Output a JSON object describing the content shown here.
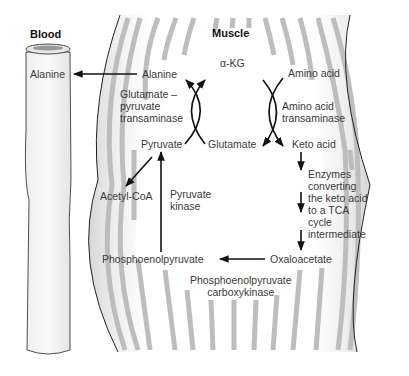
{
  "regions": {
    "blood": "Blood",
    "muscle": "Muscle"
  },
  "metabolites": {
    "alanine_blood": "Alanine",
    "alanine_muscle": "Alanine",
    "alpha_kg": "α-KG",
    "amino_acid": "Amino acid",
    "pyruvate": "Pyruvate",
    "glutamate": "Glutamate",
    "keto_acid": "Keto acid",
    "acetyl_coa": "Acetyl-CoA",
    "phosphoenolpyruvate": "Phosphoenolpyruvate",
    "oxaloacetate": "Oxaloacetate"
  },
  "enzymes": {
    "glutamate_pyruvate_transaminase": "Glutamate –\npyruvate\ntransaminase",
    "amino_acid_transaminase": "Amino acid\ntransaminase",
    "pyruvate_kinase": "Pyruvate\nkinase",
    "keto_acid_enzymes": "Enzymes\nconverting\nthe keto acid\nto a TCA\ncycle\nintermediate",
    "pepck": "Phosphoenolpyruvate\ncarboxykinase"
  },
  "colors": {
    "stripe": "#bdbdbd",
    "muscle_shade": "#dcdcdc",
    "outline": "#222222",
    "arrow": "#111111",
    "text": "#3a3a3a"
  }
}
